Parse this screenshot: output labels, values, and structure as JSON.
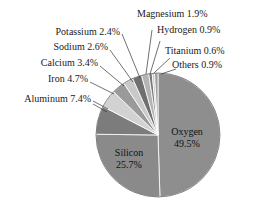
{
  "chart_data": {
    "type": "pie",
    "title": "",
    "subtitle": "",
    "xlabel": "",
    "ylabel": "",
    "legend_position": "none",
    "grid": false,
    "units": "percent",
    "total_labeled": 99.7,
    "start_angle_deg": 0,
    "direction": "clockwise",
    "categories": [
      "Oxygen",
      "Silicon",
      "Aluminum",
      "Iron",
      "Calcium",
      "Sodium",
      "Potassium",
      "Magnesium",
      "Hydrogen",
      "Titanium",
      "Others"
    ],
    "values": [
      49.5,
      25.7,
      7.4,
      4.7,
      3.4,
      2.6,
      2.4,
      1.9,
      0.9,
      0.6,
      0.9
    ],
    "slices": [
      {
        "name": "Oxygen",
        "value": 49.5,
        "value_text": "49.5%",
        "label": "Oxygen",
        "label_text": "Oxygen 49.5%",
        "color": "#8e8e8e",
        "label_placement": "inside"
      },
      {
        "name": "Silicon",
        "value": 25.7,
        "value_text": "25.7%",
        "label": "Silicon",
        "label_text": "Silicon 25.7%",
        "color": "#8a8a8a",
        "label_placement": "inside"
      },
      {
        "name": "Aluminum",
        "value": 7.4,
        "value_text": "7.4%",
        "label": "Aluminum",
        "label_text": "Aluminum 7.4%",
        "color": "#7c7c7c",
        "label_placement": "outside"
      },
      {
        "name": "Iron",
        "value": 4.7,
        "value_text": "4.7%",
        "label": "Iron",
        "label_text": "Iron 4.7%",
        "color": "#d2d2d2",
        "label_placement": "outside"
      },
      {
        "name": "Calcium",
        "value": 3.4,
        "value_text": "3.4%",
        "label": "Calcium",
        "label_text": "Calcium 3.4%",
        "color": "#9a9a9a",
        "label_placement": "outside"
      },
      {
        "name": "Sodium",
        "value": 2.6,
        "value_text": "2.6%",
        "label": "Sodium",
        "label_text": "Sodium 2.6%",
        "color": "#c9c9c9",
        "label_placement": "outside"
      },
      {
        "name": "Potassium",
        "value": 2.4,
        "value_text": "2.4%",
        "label": "Potassium",
        "label_text": "Potassium 2.4%",
        "color": "#6f6f6f",
        "label_placement": "outside"
      },
      {
        "name": "Magnesium",
        "value": 1.9,
        "value_text": "1.9%",
        "label": "Magnesium",
        "label_text": "Magnesium 1.9%",
        "color": "#b4b4b4",
        "label_placement": "outside"
      },
      {
        "name": "Hydrogen",
        "value": 0.9,
        "value_text": "0.9%",
        "label": "Hydrogen",
        "label_text": "Hydrogen 0.9%",
        "color": "#7a7a7a",
        "label_placement": "outside"
      },
      {
        "name": "Titanium",
        "value": 0.6,
        "value_text": "0.6%",
        "label": "Titanium",
        "label_text": "Titanium 0.6%",
        "color": "#c4c4c4",
        "label_placement": "outside"
      },
      {
        "name": "Others",
        "value": 0.9,
        "value_text": "0.9%",
        "label": "Others",
        "label_text": "Others 0.9%",
        "color": "#9e9e9e",
        "label_placement": "outside"
      }
    ]
  },
  "labels": {
    "magnesium": "Magnesium 1.9%",
    "hydrogen": "Hydrogen 0.9%",
    "titanium": "Titanium 0.6%",
    "others": "Others 0.9%",
    "potassium": "Potassium 2.4%",
    "sodium": "Sodium 2.6%",
    "calcium": "Calcium 3.4%",
    "iron": "Iron 4.7%",
    "aluminum": "Aluminum 7.4%",
    "oxygen_name": "Oxygen",
    "oxygen_value": "49.5%",
    "silicon_name": "Silicon",
    "silicon_value": "25.7%"
  },
  "style": {
    "background": "#ffffff",
    "slice_border": "#ffffff",
    "leader_line": "#333333",
    "text_color": "#1a1a1a"
  }
}
